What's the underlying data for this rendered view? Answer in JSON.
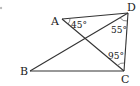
{
  "diagram": {
    "type": "geometry-quadrilateral",
    "points": {
      "A": {
        "label": "A",
        "x": 62,
        "y": 19
      },
      "B": {
        "label": "B",
        "x": 30,
        "y": 71
      },
      "C": {
        "label": "C",
        "x": 124,
        "y": 71
      },
      "D": {
        "label": "D",
        "x": 128,
        "y": 13
      }
    },
    "segments": [
      [
        "A",
        "D"
      ],
      [
        "D",
        "C"
      ],
      [
        "C",
        "B"
      ],
      [
        "B",
        "D"
      ],
      [
        "A",
        "C"
      ]
    ],
    "angles": [
      {
        "vertex": "A",
        "label": "45°"
      },
      {
        "vertex": "D",
        "label": "55°"
      },
      {
        "vertex": "C",
        "label": "95°"
      }
    ],
    "colors": {
      "line": "#333333",
      "text": "#222222",
      "background": "#ffffff"
    }
  }
}
